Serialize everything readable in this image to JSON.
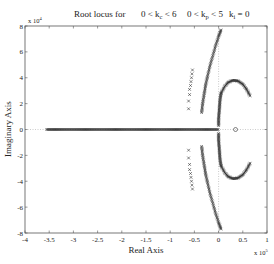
{
  "chart_data": {
    "type": "scatter",
    "title_parts": {
      "prefix": "Root locus for",
      "range1": "0 < k",
      "range1_sub": "c",
      "range1_end": " < 6",
      "range2": "0 < k",
      "range2_sub": "p",
      "range2_end": " < 5",
      "range3": "k",
      "range3_sub": "i",
      "range3_end": " = 0"
    },
    "xlabel": "Real Axis",
    "ylabel": "Imaginary Axis",
    "x_multiplier": "x 10",
    "x_multiplier_exp": "5",
    "y_multiplier": "x 10",
    "y_multiplier_exp": "4",
    "xlim": [
      -4,
      1
    ],
    "ylim": [
      -8,
      8
    ],
    "xticks": [
      -4,
      -3.5,
      -3,
      -2.5,
      -2,
      -1.5,
      -1,
      -0.5,
      0,
      0.5,
      1
    ],
    "xtick_labels": [
      "-4",
      "-3.5",
      "-3",
      "-2.5",
      "-2",
      "-1.5",
      "-1",
      "-0.5",
      "0",
      "0.5",
      "1"
    ],
    "yticks": [
      -8,
      -6,
      -4,
      -2,
      0,
      2,
      4,
      6,
      8
    ],
    "ytick_labels": [
      "-8",
      "-6",
      "-4",
      "-2",
      "0",
      "2",
      "4",
      "6",
      "8"
    ],
    "grid": false,
    "reference_lines": [
      "dotted horizontal at y=0",
      "dotted vertical at x=0"
    ],
    "series": [
      {
        "name": "real-axis-locus",
        "marker": "x",
        "x_range": [
          -3.55,
          0.0
        ],
        "y": 0,
        "note": "dense marks along the negative real axis"
      },
      {
        "name": "outer-column-branch",
        "marker": "x",
        "points_upper": [
          [
            -0.62,
            1.6
          ],
          [
            -0.62,
            2.2
          ],
          [
            -0.6,
            2.7
          ],
          [
            -0.6,
            3.1
          ],
          [
            -0.58,
            3.4
          ],
          [
            -0.57,
            3.7
          ],
          [
            -0.56,
            4.0
          ],
          [
            -0.55,
            4.3
          ],
          [
            -0.54,
            4.6
          ]
        ],
        "mirrored": true
      },
      {
        "name": "inner-curved-branch",
        "marker": "x",
        "points_upper": [
          [
            -0.35,
            1.3
          ],
          [
            -0.33,
            2.0
          ],
          [
            -0.3,
            2.7
          ],
          [
            -0.27,
            3.4
          ],
          [
            -0.23,
            4.1
          ],
          [
            -0.18,
            4.9
          ],
          [
            -0.12,
            5.7
          ],
          [
            -0.06,
            6.5
          ],
          [
            0.0,
            7.2
          ],
          [
            0.05,
            7.7
          ]
        ],
        "mirrored": true
      },
      {
        "name": "near-imag-axis-branch",
        "marker": "x",
        "points_upper": [
          [
            0.0,
            0.3
          ],
          [
            0.0,
            0.8
          ],
          [
            0.01,
            1.3
          ],
          [
            0.02,
            1.8
          ],
          [
            0.03,
            2.3
          ],
          [
            0.05,
            2.8
          ]
        ],
        "mirrored": true
      },
      {
        "name": "right-arc-branch",
        "marker": "x",
        "points_upper": [
          [
            0.05,
            2.8
          ],
          [
            0.12,
            3.3
          ],
          [
            0.2,
            3.65
          ],
          [
            0.3,
            3.8
          ],
          [
            0.4,
            3.75
          ],
          [
            0.5,
            3.5
          ],
          [
            0.58,
            3.1
          ],
          [
            0.65,
            2.6
          ]
        ],
        "mirrored": true
      },
      {
        "name": "zero",
        "marker": "o",
        "points": [
          [
            0.35,
            0
          ]
        ]
      }
    ]
  }
}
